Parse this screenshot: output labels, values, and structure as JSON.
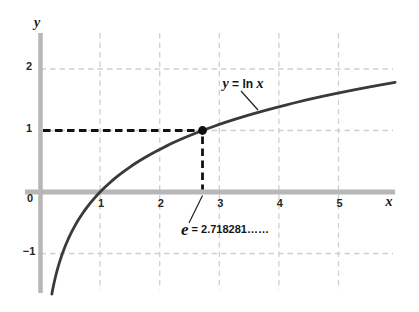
{
  "chart_data": {
    "type": "line",
    "function": "y = ln x",
    "xlabel": "x",
    "ylabel": "y",
    "xlim": [
      -0.26,
      6.35
    ],
    "ylim": [
      -1.95,
      2.6
    ],
    "grid": true,
    "legend": "none",
    "x_ticks": [
      1,
      2,
      3,
      4,
      5
    ],
    "x_tick_labels": [
      "1",
      "2",
      "3",
      "4",
      "5"
    ],
    "y_ticks": [
      2,
      1,
      -1
    ],
    "y_tick_labels": [
      "2",
      "1",
      "−1"
    ],
    "origin_label": "0",
    "curve": {
      "name": "y = ln x",
      "expr": "ln(x)",
      "x_start": 0.19,
      "x_end": 5.95,
      "sample_points": [
        [
          0.25,
          -1.386
        ],
        [
          0.5,
          -0.693
        ],
        [
          1,
          0
        ],
        [
          2,
          0.693
        ],
        [
          2.718281,
          1
        ],
        [
          4,
          1.386
        ],
        [
          5,
          1.609
        ]
      ]
    },
    "marked_point": {
      "x": 2.718281,
      "y": 1
    },
    "guides": {
      "horizontal": {
        "from_x": 0,
        "to_x": 2.718281,
        "at_y": 1
      },
      "vertical": {
        "from_y": 0,
        "to_y": 1,
        "at_x": 2.718281
      }
    },
    "colors": {
      "axis": "#b7b7b7",
      "grid": "#cfcfcf",
      "curve": "#3a3a3a",
      "marker": "#0e0e0e",
      "guide": "#111111",
      "leader": "#222222",
      "text": "#1a1a1a"
    }
  },
  "labels": {
    "curve_label": {
      "lhs": "y",
      "eq": " = ",
      "fn": "ln ",
      "arg": "x"
    },
    "point_label": {
      "symbol": "e",
      "rest": " = 2.718281……"
    }
  }
}
